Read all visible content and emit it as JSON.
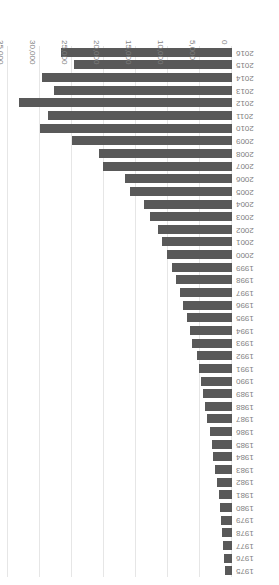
{
  "chart_data": {
    "type": "bar",
    "orientation": "horizontal",
    "title": "",
    "subtitle": "",
    "xlabel": "",
    "ylabel": "",
    "xlim": [
      0,
      35000
    ],
    "grid": true,
    "legend": "none",
    "rotation_degrees": 180,
    "value_axis_ticks": [
      0,
      5000,
      10000,
      15000,
      20000,
      25000,
      30000,
      35000
    ],
    "value_axis_tick_labels": [
      "0",
      "5,000",
      "10,000",
      "15,000",
      "20,000",
      "25,000",
      "30,000",
      "35,000"
    ],
    "bar_color": "#595959",
    "gridline_color": "#e6e6e6",
    "tick_label_color": "#7f7f7f",
    "categories": [
      "1975",
      "1976",
      "1977",
      "1978",
      "1979",
      "1980",
      "1981",
      "1982",
      "1983",
      "1984",
      "1985",
      "1986",
      "1987",
      "1988",
      "1989",
      "1990",
      "1991",
      "1992",
      "1993",
      "1994",
      "1995",
      "1996",
      "1997",
      "1998",
      "1999",
      "2000",
      "2001",
      "2002",
      "2003",
      "2004",
      "2005",
      "2006",
      "2007",
      "2008",
      "2009",
      "2010",
      "2011",
      "2012",
      "2013",
      "2014",
      "2015",
      "2016"
    ],
    "values": [
      1150,
      1250,
      1400,
      1550,
      1700,
      1900,
      2100,
      2350,
      2600,
      2900,
      3200,
      3500,
      3900,
      4200,
      4500,
      4800,
      5100,
      5500,
      6200,
      6600,
      7000,
      7600,
      8200,
      8800,
      9400,
      10100,
      11000,
      11500,
      12800,
      13800,
      16000,
      16700,
      20200,
      20800,
      25000,
      30000,
      28700,
      33300,
      27800,
      29700,
      24700,
      26700
    ]
  }
}
